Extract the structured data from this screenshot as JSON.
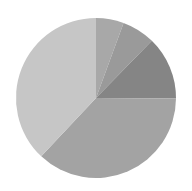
{
  "chart_data": {
    "type": "pie",
    "title": "",
    "legend": [],
    "start_angle_deg": 0,
    "direction": "clockwise",
    "slices": [
      {
        "label": "",
        "value": 5.6,
        "color": "#a8a8a8"
      },
      {
        "label": "",
        "value": 6.7,
        "color": "#9a9a9a"
      },
      {
        "label": "",
        "value": 12.8,
        "color": "#858585"
      },
      {
        "label": "",
        "value": 36.9,
        "color": "#a3a3a3"
      },
      {
        "label": "",
        "value": 38.0,
        "color": "#c6c6c6"
      }
    ],
    "center": [
      96,
      98
    ],
    "radius": 80
  }
}
